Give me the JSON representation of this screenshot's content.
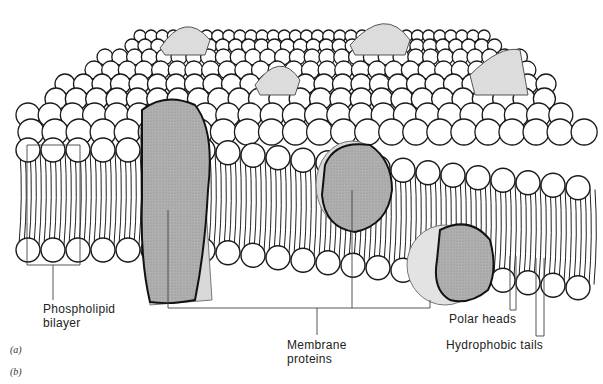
{
  "figure": {
    "colors": {
      "outline": "#1a1a1a",
      "head_fill": "#ffffff",
      "protein_fill": "#a9a9a9",
      "protein_shadow": "#d9d9d9",
      "leader_line": "#444444"
    }
  },
  "labels": {
    "phospholipid_bilayer_line1": "Phospholipid",
    "phospholipid_bilayer_line2": "bilayer",
    "membrane_proteins_line1": "Membrane",
    "membrane_proteins_line2": "proteins",
    "polar_heads": "Polar heads",
    "hydrophobic_tails": "Hydrophobic tails"
  },
  "panels": {
    "a": "(a)",
    "b": "(b)"
  }
}
